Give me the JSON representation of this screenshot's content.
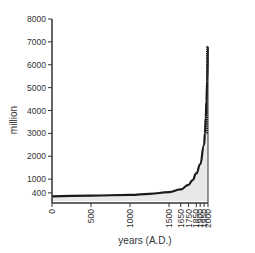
{
  "chart_data": {
    "type": "area",
    "title": "",
    "xlabel": "years (A.D.)",
    "ylabel": "million",
    "ylim": [
      0,
      8000
    ],
    "xlim": [
      0,
      2000
    ],
    "grid": false,
    "legend": null,
    "y_ticks": [
      400,
      1000,
      2000,
      3000,
      4000,
      5000,
      6000,
      7000,
      8000
    ],
    "x_ticks": [
      0,
      500,
      1000,
      1500,
      1650,
      1750,
      1850,
      1900,
      1950,
      2000
    ],
    "series": [
      {
        "name": "world population",
        "x": [
          0,
          500,
          1000,
          1250,
          1500,
          1650,
          1750,
          1800,
          1850,
          1900,
          1950,
          1960,
          1970,
          1980,
          1990,
          2000
        ],
        "values": [
          250,
          280,
          310,
          360,
          430,
          550,
          750,
          950,
          1250,
          1650,
          2500,
          3000,
          3700,
          4400,
          5300,
          6800
        ]
      }
    ]
  },
  "colors": {
    "line": "#1a1a1a",
    "fill": "#e8e8e8",
    "axis": "#333333"
  }
}
